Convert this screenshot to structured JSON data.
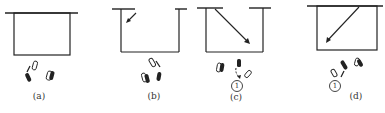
{
  "figure": {
    "panels": [
      {
        "id": "a",
        "label": "(a)"
      },
      {
        "id": "b",
        "label": "(b)"
      },
      {
        "id": "c",
        "label": "(c)",
        "marker": "1"
      },
      {
        "id": "d",
        "label": "(d)",
        "marker": "1"
      }
    ],
    "colors": {
      "ink": "#222222",
      "background": "#ffffff"
    }
  }
}
